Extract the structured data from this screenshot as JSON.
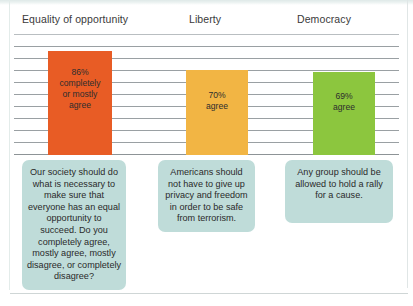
{
  "chart_data": {
    "type": "bar",
    "title": "",
    "subtitle": "",
    "xlabel": "",
    "ylabel": "",
    "ylim": [
      0,
      100
    ],
    "grid": true,
    "legend_position": "none",
    "categories": [
      "Equality of opportunity",
      "Liberty",
      "Democracy"
    ],
    "values": [
      86,
      70,
      69
    ],
    "bar_colors": [
      "#E85C25",
      "#F2B544",
      "#8CC63E"
    ],
    "data_labels": [
      "86%\ncompletely\nor mostly\nagree",
      "70%\nagree",
      "69%\nagree"
    ],
    "annotations": [
      "Our society should do what is necessary to make sure that everyone has an equal opportunity to succeed. Do you completely agree, mostly agree, mostly disagree, or completely disagree?",
      "Americans should not have to give up privacy and freedom in order to be safe from terrorism.",
      "Any group should be allowed to hold a rally for a cause."
    ]
  },
  "headers": [
    {
      "label": "Equality of opportunity"
    },
    {
      "label": "Liberty"
    },
    {
      "label": "Democracy"
    }
  ],
  "bars": [
    {
      "name": "equality-of-opportunity",
      "value": 86,
      "label_line1": "86%",
      "label_line2": "completely",
      "label_line3": "or mostly",
      "label_line4": "agree",
      "color": "#E85C25"
    },
    {
      "name": "liberty",
      "value": 70,
      "label_line1": "70%",
      "label_line2": "agree",
      "label_line3": "",
      "label_line4": "",
      "color": "#F2B544"
    },
    {
      "name": "democracy",
      "value": 69,
      "label_line1": "69%",
      "label_line2": "agree",
      "label_line3": "",
      "label_line4": "",
      "color": "#8CC63E"
    }
  ],
  "callouts": [
    {
      "text": "Our society should do what is necessary to make sure that everyone has an equal opportunity to succeed. Do you completely agree, mostly agree, mostly disagree, or completely disagree?"
    },
    {
      "text": "Americans should not have to give up privacy and freedom in order to be safe from terrorism."
    },
    {
      "text": "Any group should be allowed to hold a rally for a cause."
    }
  ],
  "colors": {
    "callout_background": "#BFDCD9",
    "gridline": "#9AA0A3",
    "page_background": "#FFFFFF"
  }
}
